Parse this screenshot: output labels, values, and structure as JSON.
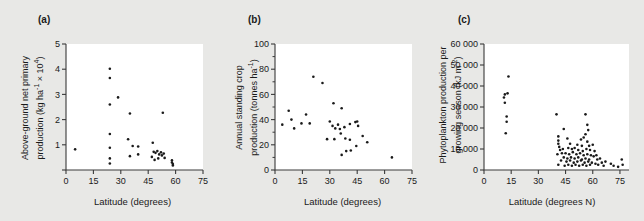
{
  "figure": {
    "background_color": "#e8e8e6",
    "plot_background_color": "#ffffff",
    "marker_color": "#1a1a1a",
    "axis_color": "#3a3a3a"
  },
  "panels": [
    {
      "label": "(a)",
      "ylabel_line1": "Above-ground net primary",
      "ylabel_line2": "production (kg ha",
      "ylabel_sup1": "-1",
      "ylabel_mid": " × 10",
      "ylabel_sup2": "4",
      "ylabel_end": ")",
      "xlabel": "Latitude (degrees)"
    },
    {
      "label": "(b)",
      "ylabel_line1": "Annual standing crop",
      "ylabel_line2": "production (tonnes ha",
      "ylabel_sup1": "-1",
      "ylabel_end": ")",
      "xlabel": "Latitude (degrees)"
    },
    {
      "label": "(c)",
      "ylabel_line1": "Phytoplankton production per",
      "ylabel_line2": "growing season (kJ m",
      "ylabel_sup1": "-2",
      "ylabel_end": ")",
      "xlabel": "Latitude (degrees N)"
    }
  ],
  "chart_data": [
    {
      "type": "scatter",
      "panel": "a",
      "title": "",
      "xlabel": "Latitude (degrees)",
      "ylabel": "Above-ground net primary production (kg ha-1 x 10^4)",
      "xlim": [
        0,
        75
      ],
      "ylim": [
        0,
        5
      ],
      "xticks": [
        0,
        15,
        30,
        45,
        60,
        75
      ],
      "yticks": [
        0,
        1,
        2,
        3,
        4,
        5
      ],
      "ytick_labels": [
        "",
        "1",
        "2",
        "3",
        "4",
        "5"
      ],
      "grid": false,
      "legend": "none",
      "points": [
        [
          5.0,
          0.82
        ],
        [
          24.0,
          4.02
        ],
        [
          24.0,
          3.65
        ],
        [
          24.0,
          2.6
        ],
        [
          28.5,
          2.88
        ],
        [
          24.0,
          1.43
        ],
        [
          35.0,
          2.24
        ],
        [
          53.0,
          2.27
        ],
        [
          24.0,
          0.88
        ],
        [
          24.0,
          0.46
        ],
        [
          24.0,
          0.26
        ],
        [
          34.0,
          1.22
        ],
        [
          36.5,
          0.95
        ],
        [
          39.5,
          0.93
        ],
        [
          35.0,
          0.55
        ],
        [
          39.5,
          0.62
        ],
        [
          47.5,
          1.08
        ],
        [
          48.0,
          0.72
        ],
        [
          49.0,
          0.68
        ],
        [
          47.0,
          0.52
        ],
        [
          48.5,
          0.4
        ],
        [
          50.0,
          0.75
        ],
        [
          51.0,
          0.62
        ],
        [
          52.0,
          0.7
        ],
        [
          52.5,
          0.58
        ],
        [
          53.5,
          0.65
        ],
        [
          50.5,
          0.46
        ],
        [
          54.0,
          0.48
        ],
        [
          58.0,
          0.38
        ],
        [
          58.0,
          0.3
        ],
        [
          58.5,
          0.24
        ],
        [
          58.5,
          0.18
        ]
      ]
    },
    {
      "type": "scatter",
      "panel": "b",
      "title": "",
      "xlabel": "Latitude (degrees)",
      "ylabel": "Annual standing crop production (tonnes ha-1)",
      "xlim": [
        0,
        75
      ],
      "ylim": [
        0,
        100
      ],
      "xticks": [
        0,
        15,
        30,
        45,
        60,
        75
      ],
      "yticks": [
        0,
        20,
        40,
        60,
        80,
        100
      ],
      "minor_yticks": [
        10,
        30,
        50,
        70,
        90
      ],
      "grid": false,
      "legend": "none",
      "points": [
        [
          21.0,
          74.0
        ],
        [
          26.0,
          69.0
        ],
        [
          32.0,
          53.0
        ],
        [
          36.5,
          49.0
        ],
        [
          7.5,
          47.0
        ],
        [
          17.0,
          44.0
        ],
        [
          9.0,
          40.0
        ],
        [
          4.0,
          36.0
        ],
        [
          10.5,
          33.0
        ],
        [
          14.5,
          37.0
        ],
        [
          19.0,
          37.0
        ],
        [
          30.0,
          38.5
        ],
        [
          31.5,
          35.0
        ],
        [
          34.5,
          36.0
        ],
        [
          33.0,
          33.0
        ],
        [
          35.5,
          32.5
        ],
        [
          38.0,
          34.0
        ],
        [
          41.0,
          36.5
        ],
        [
          44.0,
          38.0
        ],
        [
          45.0,
          38.5
        ],
        [
          45.5,
          35.0
        ],
        [
          36.0,
          29.0
        ],
        [
          38.5,
          25.0
        ],
        [
          28.5,
          24.5
        ],
        [
          32.5,
          24.5
        ],
        [
          41.0,
          24.0
        ],
        [
          48.0,
          27.0
        ],
        [
          50.5,
          22.0
        ],
        [
          44.5,
          19.0
        ],
        [
          41.5,
          15.5
        ],
        [
          39.0,
          15.0
        ],
        [
          36.5,
          12.0
        ],
        [
          64.0,
          10.0
        ]
      ]
    },
    {
      "type": "scatter",
      "panel": "c",
      "title": "",
      "xlabel": "Latitude (degrees N)",
      "ylabel": "Phytoplankton production per growing season (kJ m-2)",
      "xlim": [
        0,
        80
      ],
      "ylim": [
        0,
        60000
      ],
      "xticks": [
        0,
        15,
        30,
        45,
        60,
        75
      ],
      "yticks": [
        0,
        10000,
        20000,
        30000,
        40000,
        50000,
        60000
      ],
      "ytick_labels": [
        "0",
        "10 000",
        "20 000",
        "30 000",
        "40 000",
        "50 000",
        "60 000"
      ],
      "grid": false,
      "legend": "none",
      "points": [
        [
          13.5,
          44500
        ],
        [
          11.5,
          36000
        ],
        [
          13.0,
          36500
        ],
        [
          11.0,
          34500
        ],
        [
          11.5,
          32000
        ],
        [
          12.5,
          25500
        ],
        [
          12.5,
          23000
        ],
        [
          12.0,
          17500
        ],
        [
          40.0,
          26500
        ],
        [
          56.0,
          26500
        ],
        [
          57.0,
          21500
        ],
        [
          44.0,
          19500
        ],
        [
          57.5,
          19000
        ],
        [
          41.0,
          16000
        ],
        [
          56.0,
          17000
        ],
        [
          55.0,
          15500
        ],
        [
          41.0,
          14000
        ],
        [
          46.0,
          15000
        ],
        [
          53.5,
          14500
        ],
        [
          57.0,
          13500
        ],
        [
          41.0,
          12500
        ],
        [
          41.5,
          11000
        ],
        [
          47.5,
          12500
        ],
        [
          51.5,
          12000
        ],
        [
          54.0,
          11500
        ],
        [
          58.0,
          11500
        ],
        [
          60.0,
          12000
        ],
        [
          42.0,
          9500
        ],
        [
          43.5,
          10000
        ],
        [
          46.5,
          10500
        ],
        [
          48.5,
          10000
        ],
        [
          50.0,
          10500
        ],
        [
          52.0,
          9500
        ],
        [
          54.5,
          9000
        ],
        [
          56.5,
          10000
        ],
        [
          58.5,
          9500
        ],
        [
          61.0,
          9000
        ],
        [
          43.0,
          8000
        ],
        [
          45.0,
          8000
        ],
        [
          47.0,
          7500
        ],
        [
          49.0,
          8500
        ],
        [
          51.0,
          7500
        ],
        [
          53.0,
          8000
        ],
        [
          55.0,
          7000
        ],
        [
          57.0,
          7500
        ],
        [
          59.0,
          7000
        ],
        [
          60.5,
          6500
        ],
        [
          62.0,
          7000
        ],
        [
          40.5,
          7500
        ],
        [
          44.0,
          6000
        ],
        [
          46.0,
          5500
        ],
        [
          48.0,
          6000
        ],
        [
          50.0,
          5500
        ],
        [
          52.0,
          6000
        ],
        [
          54.0,
          5000
        ],
        [
          56.0,
          5500
        ],
        [
          58.0,
          5000
        ],
        [
          62.5,
          5000
        ],
        [
          64.0,
          5500
        ],
        [
          42.5,
          4500
        ],
        [
          45.5,
          4000
        ],
        [
          47.5,
          4500
        ],
        [
          49.5,
          3500
        ],
        [
          51.5,
          4000
        ],
        [
          53.5,
          4500
        ],
        [
          55.5,
          3500
        ],
        [
          57.5,
          4000
        ],
        [
          59.5,
          3500
        ],
        [
          61.5,
          3000
        ],
        [
          65.0,
          3500
        ],
        [
          67.0,
          4000
        ],
        [
          41.0,
          2500
        ],
        [
          44.5,
          2000
        ],
        [
          46.5,
          2500
        ],
        [
          48.5,
          2000
        ],
        [
          50.5,
          2500
        ],
        [
          52.5,
          2000
        ],
        [
          54.5,
          2500
        ],
        [
          56.5,
          2000
        ],
        [
          58.5,
          2500
        ],
        [
          63.0,
          2500
        ],
        [
          66.0,
          2000
        ],
        [
          70.0,
          3000
        ],
        [
          71.5,
          2000
        ],
        [
          76.0,
          5000
        ],
        [
          76.5,
          2500
        ],
        [
          74.0,
          1500
        ]
      ]
    }
  ]
}
